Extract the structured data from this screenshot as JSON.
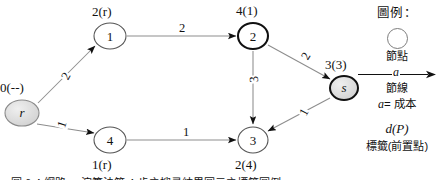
{
  "diagram": {
    "title_hidden": "",
    "nodes": [
      {
        "id": "r",
        "glyph": "r",
        "italic": true,
        "label": "0(--)",
        "label_pos": "above",
        "shaded": true,
        "bold": false,
        "x": 22,
        "y": 113,
        "rx": 17,
        "ry": 13
      },
      {
        "id": "1",
        "glyph": "1",
        "italic": false,
        "label": "2(r)",
        "label_pos": "above",
        "shaded": false,
        "bold": false,
        "x": 110,
        "y": 36,
        "rx": 16,
        "ry": 13
      },
      {
        "id": "4",
        "glyph": "4",
        "italic": false,
        "label": "1(r)",
        "label_pos": "below",
        "shaded": false,
        "bold": false,
        "x": 110,
        "y": 140,
        "rx": 16,
        "ry": 13
      },
      {
        "id": "2",
        "glyph": "2",
        "italic": false,
        "label": "4(1)",
        "label_pos": "above",
        "shaded": false,
        "bold": true,
        "x": 253,
        "y": 36,
        "rx": 15,
        "ry": 13
      },
      {
        "id": "3",
        "glyph": "3",
        "italic": false,
        "label": "2(4)",
        "label_pos": "below",
        "shaded": false,
        "bold": false,
        "x": 253,
        "y": 140,
        "rx": 15,
        "ry": 13
      },
      {
        "id": "s",
        "glyph": "s",
        "italic": true,
        "label": "3(3)",
        "label_pos": "above",
        "shaded": true,
        "bold": true,
        "x": 344,
        "y": 88,
        "rx": 14,
        "ry": 12
      }
    ],
    "edges": [
      {
        "from": "r",
        "to": "1",
        "cost": "2",
        "rotated": true
      },
      {
        "from": "r",
        "to": "4",
        "cost": "1",
        "rotated": true
      },
      {
        "from": "1",
        "to": "2",
        "cost": "2",
        "rotated": false
      },
      {
        "from": "4",
        "to": "3",
        "cost": "1",
        "rotated": false
      },
      {
        "from": "2",
        "to": "3",
        "cost": "3",
        "rotated": true
      },
      {
        "from": "2",
        "to": "s",
        "cost": "2",
        "rotated": true
      },
      {
        "from": "3",
        "to": "s",
        "cost": "1",
        "rotated": true
      }
    ]
  },
  "legend": {
    "title": "圖例：",
    "node_caption": "節點",
    "edge_symbol": "a",
    "edge_caption": "節線",
    "cost_note_prefix": "a",
    "cost_note": "= 成本",
    "dp_symbol": "d(P)",
    "dp_caption": "標籤(前置點)"
  },
  "caption": {
    "text": "圖 6-4  網路 ... 演算法第 4 步之搜尋結果圖示之標籤圖例"
  }
}
